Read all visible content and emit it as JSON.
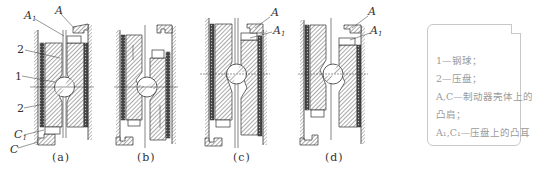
{
  "figure": {
    "panels": [
      {
        "id": "a",
        "caption": "(a)",
        "labels": [
          "A1",
          "A",
          "2",
          "1",
          "2",
          "C1",
          "C"
        ]
      },
      {
        "id": "b",
        "caption": "(b)",
        "labels": []
      },
      {
        "id": "c",
        "caption": "(c)",
        "labels": [
          "A",
          "A1"
        ]
      },
      {
        "id": "d",
        "caption": "(d)",
        "labels": [
          "A",
          "A1"
        ]
      }
    ],
    "label_text": {
      "A": "A",
      "A1": "A",
      "sub1": "1",
      "C": "C",
      "C1": "C",
      "n1": "1",
      "n2": "2"
    }
  },
  "legend": {
    "lines": [
      "1—钢球；",
      "2—压盘；",
      "A,C—制动器壳体上的",
      "凸肩；",
      "A₁,C₁—压盘上的凸耳"
    ]
  },
  "colors": {
    "line": "#333333",
    "hatch": "#555555",
    "legend_text": "#9a9a9a",
    "legend_border": "#c8c8c8"
  }
}
